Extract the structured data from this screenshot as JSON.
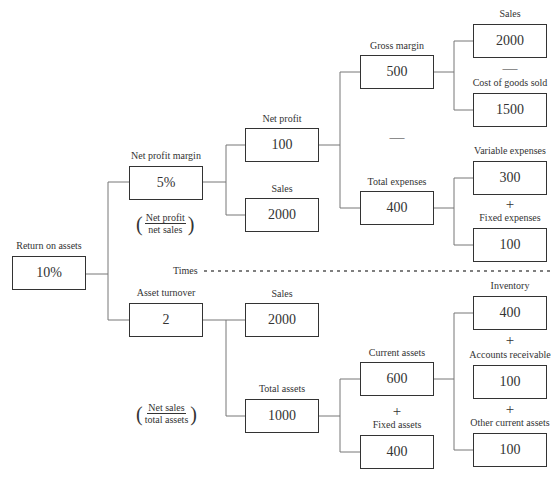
{
  "diagram": {
    "root": {
      "label": "Return on assets",
      "value": "10%"
    },
    "net_profit_margin": {
      "label": "Net profit margin",
      "value": "5%",
      "formula": {
        "numerator": "Net profit",
        "denominator": "net sales"
      }
    },
    "net_profit": {
      "label": "Net profit",
      "value": "100"
    },
    "sales_upper": {
      "label": "Sales",
      "value": "2000"
    },
    "gross_margin": {
      "label": "Gross margin",
      "value": "500"
    },
    "total_expenses": {
      "label": "Total expenses",
      "value": "400"
    },
    "sales_gm": {
      "label": "Sales",
      "value": "2000"
    },
    "cogs": {
      "label": "Cost of goods sold",
      "value": "1500"
    },
    "variable_expenses": {
      "label": "Variable expenses",
      "value": "300"
    },
    "fixed_expenses": {
      "label": "Fixed expenses",
      "value": "100"
    },
    "times_label": "Times",
    "asset_turnover": {
      "label": "Asset turnover",
      "value": "2",
      "formula": {
        "numerator": "Net sales",
        "denominator": "total assets"
      }
    },
    "sales_lower": {
      "label": "Sales",
      "value": "2000"
    },
    "total_assets": {
      "label": "Total assets",
      "value": "1000"
    },
    "current_assets": {
      "label": "Current assets",
      "value": "600"
    },
    "fixed_assets": {
      "label": "Fixed assets",
      "value": "400"
    },
    "inventory": {
      "label": "Inventory",
      "value": "400"
    },
    "accounts_receivable": {
      "label": "Accounts receivable",
      "value": "100"
    },
    "other_current_assets": {
      "label": "Other current assets",
      "value": "100"
    },
    "operators": {
      "minus": "—",
      "plus": "+"
    }
  }
}
